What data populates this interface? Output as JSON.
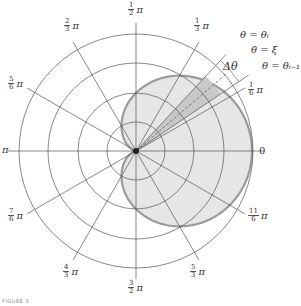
{
  "figure": {
    "type": "polar-area-diagram",
    "center": [
      136,
      151
    ],
    "grid_circle_radii": [
      29,
      58,
      88,
      117
    ],
    "curve": {
      "equation": "r = a(1 + cos θ)",
      "a": 58,
      "fill": "#e6e6e6",
      "stroke": "#9a9a9a"
    },
    "wedge": {
      "theta_start_deg": 34,
      "theta_end_deg": 47,
      "xi_deg": 40.5,
      "fill": "#c8c8c8"
    },
    "colors": {
      "grid": "#555555",
      "curve_stroke": "#9a9a9a",
      "region_fill": "#e6e6e6",
      "wedge_fill": "#c8c8c8"
    }
  },
  "angle_labels": [
    {
      "id": "zero",
      "text": "0"
    },
    {
      "id": "pi_over_6",
      "num": "1",
      "den": "6",
      "pi": "π"
    },
    {
      "id": "pi_over_3",
      "num": "1",
      "den": "3",
      "pi": "π"
    },
    {
      "id": "pi_over_2",
      "num": "1",
      "den": "2",
      "pi": "π"
    },
    {
      "id": "two_pi_over_3",
      "num": "2",
      "den": "3",
      "pi": "π"
    },
    {
      "id": "five_pi_over_6",
      "num": "5",
      "den": "6",
      "pi": "π"
    },
    {
      "id": "pi",
      "text": "π"
    },
    {
      "id": "seven_pi_over_6",
      "num": "7",
      "den": "6",
      "pi": "π"
    },
    {
      "id": "four_pi_over_3",
      "num": "4",
      "den": "3",
      "pi": "π"
    },
    {
      "id": "three_pi_over_2",
      "num": "3",
      "den": "2",
      "pi": "π"
    },
    {
      "id": "five_pi_over_3",
      "num": "5",
      "den": "3",
      "pi": "π"
    },
    {
      "id": "eleven_pi_over_6",
      "num": "11",
      "den": "6",
      "pi": "π"
    }
  ],
  "annotations": {
    "theta_i": "θ = θᵢ",
    "xi": "θ = ξ",
    "theta_i_minus_1": "θ = θᵢ₋₁",
    "delta_theta": "Δθ"
  },
  "caption": "FIGURE 3"
}
